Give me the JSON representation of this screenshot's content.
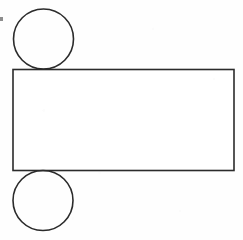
{
  "figure": {
    "title": "Geometric figure: rectangle with two tangent circles",
    "background_color": "#fefefe",
    "stroke_color": "#2b2b2b",
    "fill_color": "#ffffff",
    "stroke_width": 1.6,
    "canvas": {
      "width": 243,
      "height": 240
    },
    "shapes": [
      {
        "id": "circle-top",
        "name": "top-circle",
        "type": "circle",
        "cx": 43.5,
        "cy": 39.0,
        "r": 30.0,
        "fill": "none",
        "stroke": "#2b2b2b",
        "stroke_width": 1.6
      },
      {
        "id": "rectangle-main",
        "name": "main-rectangle",
        "type": "rect",
        "x": 13.0,
        "y": 69.5,
        "width": 221.0,
        "height": 101.0,
        "fill": "#ffffff",
        "stroke": "#2b2b2b",
        "stroke_width": 1.6
      },
      {
        "id": "circle-bottom",
        "name": "bottom-circle",
        "type": "circle",
        "cx": 43.0,
        "cy": 200.5,
        "r": 30.0,
        "fill": "none",
        "stroke": "#2b2b2b",
        "stroke_width": 1.6
      }
    ],
    "artifacts": [
      {
        "id": "speck-left-edge",
        "name": "scan-speck",
        "x": 0,
        "y": 17,
        "width": 3,
        "height": 4,
        "color": "#8d8d8d"
      }
    ]
  }
}
